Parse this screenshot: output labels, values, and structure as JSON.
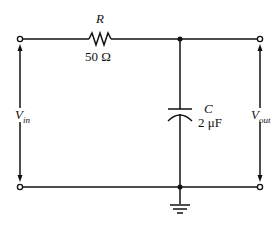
{
  "diagram": {
    "type": "RC low-pass filter circuit",
    "resistor": {
      "symbol": "R",
      "value": "50 Ω"
    },
    "capacitor": {
      "symbol": "C",
      "value": "2 μF"
    },
    "input": {
      "label_main": "V",
      "label_sub": "in"
    },
    "output": {
      "label_main": "V",
      "label_sub": "out"
    },
    "colors": {
      "line": "#111111",
      "background": "#ffffff"
    }
  }
}
